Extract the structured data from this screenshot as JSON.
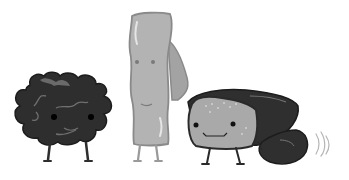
{
  "scene": {
    "description": "Grayscale cartoon illustration of three food characters",
    "colors": {
      "background": "#ffffff",
      "dark": "#2e2e2e",
      "dark_outline": "#1c1c1c",
      "mid_gray": "#a9a9a9",
      "light_gray": "#b9b9b9",
      "outline_gray": "#8a8a8a",
      "highlight": "#e6e6e6",
      "vein": "#6f6f6f"
    },
    "characters": [
      {
        "id": "dark-leafy-blob",
        "position": "left"
      },
      {
        "id": "tall-gray-strip",
        "position": "center"
      },
      {
        "id": "hooded-round-character",
        "position": "right"
      }
    ]
  }
}
